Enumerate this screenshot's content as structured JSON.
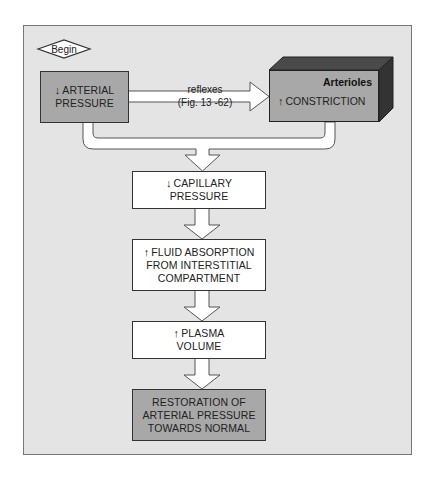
{
  "diagram": {
    "start": {
      "label": "Begin",
      "shape": "diamond"
    },
    "nodes": [
      {
        "id": "arterial_pressure",
        "direction": "↓",
        "lines": [
          "ARTERIAL",
          "PRESSURE"
        ],
        "fill": "gray"
      },
      {
        "id": "arterioles",
        "title": "Arterioles",
        "direction": "↑",
        "text": "CONSTRICTION",
        "fill": "gray",
        "shape": "3d-box"
      },
      {
        "id": "capillary_pressure",
        "direction": "↓",
        "lines": [
          "CAPILLARY",
          "PRESSURE"
        ],
        "fill": "white"
      },
      {
        "id": "fluid_absorption",
        "direction": "↑",
        "lines": [
          "FLUID ABSORPTION",
          "FROM INTERSTITIAL",
          "COMPARTMENT"
        ],
        "fill": "white"
      },
      {
        "id": "plasma_volume",
        "direction": "↑",
        "lines": [
          "PLASMA",
          "VOLUME"
        ],
        "fill": "white"
      },
      {
        "id": "restoration",
        "direction": "",
        "lines": [
          "RESTORATION OF",
          "ARTERIAL PRESSURE",
          "TOWARDS NORMAL"
        ],
        "fill": "gray"
      }
    ],
    "edges": [
      {
        "from": "arterial_pressure",
        "to": "arterioles",
        "label": [
          "reflexes",
          "(Fig. 13 -62)"
        ]
      },
      {
        "from": "arterial_pressure",
        "to": "capillary_pressure",
        "label": []
      },
      {
        "from": "arterioles",
        "to": "capillary_pressure",
        "label": []
      },
      {
        "from": "capillary_pressure",
        "to": "fluid_absorption",
        "label": []
      },
      {
        "from": "fluid_absorption",
        "to": "plasma_volume",
        "label": []
      },
      {
        "from": "plasma_volume",
        "to": "restoration",
        "label": []
      }
    ]
  },
  "colors": {
    "panel": "#e4e4e4",
    "gray_box": "#a8a8a8",
    "white_box": "#ffffff",
    "cube_top": "#4a4a4a",
    "cube_side": "#333333",
    "outline": "#333333"
  }
}
